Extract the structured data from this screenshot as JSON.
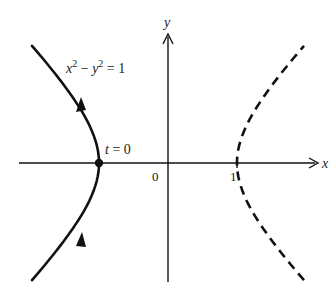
{
  "figure": {
    "equation_lhs_x": "x",
    "equation_sup1": "2",
    "equation_mid": " − y",
    "equation_sup2": "2",
    "equation_rhs": " = 1",
    "point_label": "t = 0",
    "origin_label": "0",
    "tick_label_one": "1",
    "x_axis_label": "x",
    "y_axis_label": "y",
    "colors": {
      "stroke": "#111111",
      "background": "#ffffff"
    }
  },
  "geometry": {
    "origin_px": [
      168,
      163
    ],
    "unit_px": 69,
    "x_range": [
      -2.1,
      2.3
    ],
    "y_range": [
      -1.7,
      1.8
    ],
    "left_branch": {
      "style": "solid",
      "t_range": [
        -1.3,
        1.3
      ],
      "direction": "upward arrows"
    },
    "right_branch": {
      "style": "dashed",
      "t_range": [
        -1.3,
        1.3
      ]
    }
  }
}
